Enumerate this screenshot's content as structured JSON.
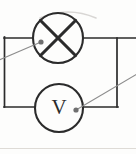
{
  "figure": {
    "kind": "circuit-diagram",
    "background_color": "#fdfdfc",
    "ink_color": "#2b2b2b",
    "leader_color": "#8d8d8d",
    "faint_rule_color": "#d8d6d2"
  },
  "components": {
    "lamp": {
      "symbol_name": "lamp-circle-cross",
      "label": "",
      "center_x": 58,
      "center_y": 38,
      "radius": 25
    },
    "voltmeter": {
      "symbol_name": "voltmeter-circle",
      "label": "V",
      "center_x": 59,
      "center_y": 108,
      "radius": 24
    }
  },
  "wires": {
    "top_rail_y": 38,
    "bottom_rail_y": 107,
    "left_rail_x": 4,
    "right_rail_x": 117,
    "top_rail_right_end_x": 136,
    "segments": [
      "top-left-lead",
      "top-right-lead",
      "left-vertical",
      "right-vertical",
      "bottom-left-lead",
      "bottom-right-lead"
    ]
  },
  "callouts": [
    {
      "name": "lamp-callout",
      "dot_x": 41,
      "dot_y": 42,
      "line_to_x": -6,
      "line_to_y": 62
    },
    {
      "name": "voltmeter-callout",
      "dot_x": 76,
      "dot_y": 110,
      "line_to_x": 142,
      "line_to_y": 72
    }
  ],
  "rules": {
    "top_arc_visible": true,
    "bottom_rule_y": 148
  }
}
